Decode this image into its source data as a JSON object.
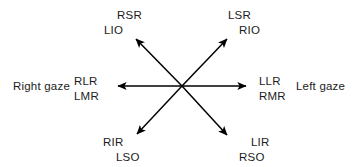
{
  "diagram": {
    "background_color": "#ffffff",
    "line_color": "#000000",
    "text_color": "#1c1c1c",
    "center": {
      "x": 182,
      "y": 86
    },
    "gaze": {
      "right_label": "Right gaze",
      "left_label": "Left gaze"
    },
    "labels": {
      "upper_left": {
        "line1": "RSR",
        "line2": "LIO"
      },
      "upper_right": {
        "line1": "LSR",
        "line2": "RIO"
      },
      "left_middle": {
        "line1": "RLR",
        "line2": "LMR"
      },
      "right_middle": {
        "line1": "LLR",
        "line2": "RMR"
      },
      "lower_left": {
        "line1": "RIR",
        "line2": "LSO"
      },
      "lower_right": {
        "line1": "LIR",
        "line2": "RSO"
      }
    },
    "arrows": [
      {
        "name": "arrow-upper-left",
        "direction": "up-left",
        "tip_x": 132,
        "tip_y": 35
      },
      {
        "name": "arrow-upper-right",
        "direction": "up-right",
        "tip_x": 231,
        "tip_y": 34
      },
      {
        "name": "arrow-left",
        "direction": "left",
        "tip_x": 113,
        "tip_y": 86
      },
      {
        "name": "arrow-right",
        "direction": "right",
        "tip_x": 251,
        "tip_y": 86
      },
      {
        "name": "arrow-lower-left",
        "direction": "down-left",
        "tip_x": 133,
        "tip_y": 139
      },
      {
        "name": "arrow-lower-right",
        "direction": "down-right",
        "tip_x": 231,
        "tip_y": 140
      }
    ]
  }
}
